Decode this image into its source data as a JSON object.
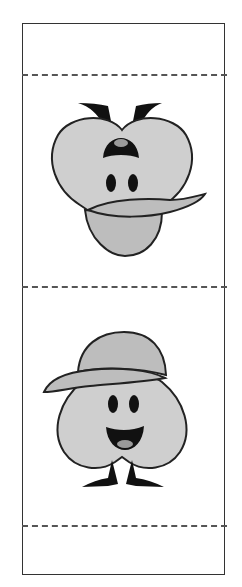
{
  "card": {
    "fold_lines": [
      75,
      287,
      526
    ],
    "fill_color": "#c8c8c8",
    "outline_color": "#222222",
    "figures": [
      {
        "name": "top-figure",
        "description": "inverted club character with cap brim and face"
      },
      {
        "name": "bottom-figure",
        "description": "club character wearing baseball cap, smiling"
      }
    ]
  }
}
